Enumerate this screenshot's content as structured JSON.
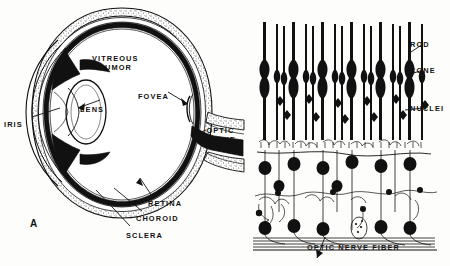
{
  "figure": {
    "panel_letter": "A",
    "background_color": "#fdfdfb",
    "ink_color": "#111111"
  },
  "panel_a": {
    "name": "eye-cross-section",
    "labels": [
      {
        "id": "vitreous-humor",
        "line1": "VITREOUS",
        "line2": "HUMOR",
        "x": 92,
        "y": 54
      },
      {
        "id": "fovea",
        "text": "FOVEA",
        "x": 138,
        "y": 92
      },
      {
        "id": "lens",
        "text": "LENS",
        "x": 80,
        "y": 105
      },
      {
        "id": "iris",
        "text": "IRIS",
        "x": 4,
        "y": 120
      },
      {
        "id": "optic-nerve",
        "line1": "OPTIC",
        "line2": "NERVE",
        "x": 205,
        "y": 126
      },
      {
        "id": "retina",
        "text": "RETINA",
        "x": 148,
        "y": 199
      },
      {
        "id": "choroid",
        "text": "CHOROID",
        "x": 136,
        "y": 214
      },
      {
        "id": "sclera",
        "text": "SCLERA",
        "x": 126,
        "y": 231
      }
    ]
  },
  "panel_b": {
    "name": "retina-cell-layers",
    "labels": [
      {
        "id": "rod",
        "text": "ROD",
        "x": 410,
        "y": 40
      },
      {
        "id": "cone",
        "text": "CONE",
        "x": 410,
        "y": 66
      },
      {
        "id": "nuclei",
        "text": "NUCLEI",
        "x": 410,
        "y": 104
      },
      {
        "id": "optic-nerve-fiber",
        "text": "OPTIC NERVE FIBER",
        "x": 307,
        "y": 243
      }
    ]
  }
}
